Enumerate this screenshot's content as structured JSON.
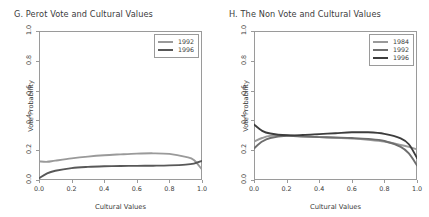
{
  "figure": {
    "background": "#ffffff",
    "panels": [
      "G",
      "H"
    ]
  },
  "panel_g": {
    "title": "G. Perot Vote and Cultural Values",
    "xlabel": "Cultural Values",
    "ylabel": "Vote Probability",
    "xticks": [
      "0.0",
      "0.2",
      "0.4",
      "0.6",
      "0.8",
      "1.0"
    ],
    "yticks": [
      "0.0",
      "0.2",
      "0.4",
      "0.6",
      "0.8",
      "1.0"
    ],
    "legend": [
      {
        "label": "1992",
        "color": "#9a9a9a"
      },
      {
        "label": "1996",
        "color": "#585858"
      }
    ]
  },
  "panel_h": {
    "title": "H. The Non Vote and Cultural Values",
    "xlabel": "Cultural Values",
    "ylabel": "Vote Probability",
    "xticks": [
      "0.0",
      "0.2",
      "0.4",
      "0.6",
      "0.8",
      "1.0"
    ],
    "yticks": [
      "0.0",
      "0.2",
      "0.4",
      "0.6",
      "0.8",
      "1.0"
    ],
    "legend": [
      {
        "label": "1984",
        "color": "#9a9a9a"
      },
      {
        "label": "1992",
        "color": "#6e6e6e"
      },
      {
        "label": "1996",
        "color": "#3d3d3d"
      }
    ]
  },
  "chart_data": [
    {
      "type": "line",
      "panel": "G",
      "title": "G. Perot Vote and Cultural Values",
      "xlabel": "Cultural Values",
      "ylabel": "Vote Probability",
      "xlim": [
        0.0,
        1.0
      ],
      "ylim": [
        0.0,
        1.0
      ],
      "grid": false,
      "legend_position": "top-right",
      "x": [
        0.0,
        0.05,
        0.1,
        0.2,
        0.3,
        0.4,
        0.5,
        0.6,
        0.7,
        0.8,
        0.9,
        0.95,
        1.0
      ],
      "series": [
        {
          "name": "1992",
          "color": "#9a9a9a",
          "values": [
            0.125,
            0.122,
            0.13,
            0.145,
            0.157,
            0.166,
            0.172,
            0.177,
            0.179,
            0.175,
            0.155,
            0.135,
            0.07
          ]
        },
        {
          "name": "1996",
          "color": "#585858",
          "values": [
            0.012,
            0.045,
            0.062,
            0.08,
            0.088,
            0.092,
            0.094,
            0.095,
            0.096,
            0.098,
            0.103,
            0.11,
            0.128
          ]
        }
      ]
    },
    {
      "type": "line",
      "panel": "H",
      "title": "H. The Non Vote and Cultural Values",
      "xlabel": "Cultural Values",
      "ylabel": "Vote Probability",
      "xlim": [
        0.0,
        1.0
      ],
      "ylim": [
        0.0,
        1.0
      ],
      "grid": false,
      "legend_position": "top-right",
      "x": [
        0.0,
        0.05,
        0.1,
        0.2,
        0.3,
        0.4,
        0.5,
        0.6,
        0.7,
        0.8,
        0.9,
        0.95,
        1.0
      ],
      "series": [
        {
          "name": "1984",
          "color": "#9a9a9a",
          "values": [
            0.258,
            0.282,
            0.296,
            0.3,
            0.294,
            0.288,
            0.283,
            0.278,
            0.27,
            0.258,
            0.235,
            0.222,
            0.205
          ]
        },
        {
          "name": "1992",
          "color": "#6e6e6e",
          "values": [
            0.212,
            0.258,
            0.282,
            0.296,
            0.292,
            0.288,
            0.285,
            0.282,
            0.276,
            0.262,
            0.222,
            0.178,
            0.098
          ]
        },
        {
          "name": "1996",
          "color": "#3d3d3d",
          "values": [
            0.372,
            0.33,
            0.312,
            0.3,
            0.302,
            0.308,
            0.314,
            0.32,
            0.32,
            0.31,
            0.28,
            0.24,
            0.148
          ]
        }
      ]
    }
  ]
}
